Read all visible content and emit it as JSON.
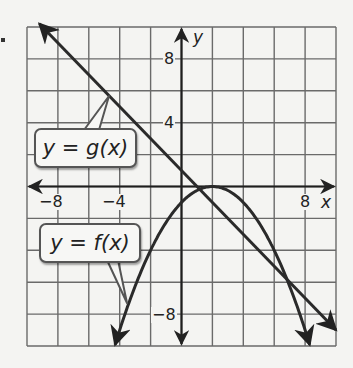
{
  "chart_data": {
    "type": "line",
    "title": "",
    "xlabel": "x",
    "ylabel": "y",
    "xlim": [
      -10,
      10
    ],
    "ylim": [
      -10,
      10
    ],
    "grid": true,
    "grid_step": 2,
    "x_tick_labels": [
      "-8",
      "-4",
      "8"
    ],
    "y_tick_labels": [
      "8",
      "4",
      "-8"
    ],
    "series": [
      {
        "name": "y = g(x)",
        "kind": "line",
        "equation_estimate": "g(x) = -x + 1",
        "points": [
          [
            -9,
            10
          ],
          [
            1,
            0
          ],
          [
            10,
            -9
          ]
        ],
        "arrows": "both ends"
      },
      {
        "name": "y = f(x)",
        "kind": "parabola",
        "equation_estimate": "f(x) = -0.25(x - 2)^2",
        "vertex": [
          2,
          0
        ],
        "points": [
          [
            -4,
            -9
          ],
          [
            -2,
            -4
          ],
          [
            0,
            -1
          ],
          [
            2,
            0
          ],
          [
            4,
            -1
          ],
          [
            6,
            -4
          ],
          [
            8,
            -9
          ]
        ],
        "arrows": "both ends"
      }
    ],
    "annotations": [
      {
        "text": "y = g(x)",
        "points_to": [
          -4.7,
          5.6
        ]
      },
      {
        "text": "y = f(x)",
        "points_to": [
          -3.6,
          -7.3
        ]
      }
    ]
  },
  "labels": {
    "g_callout": "y = g(x)",
    "f_callout": "y = f(x)",
    "x_axis": "x",
    "y_axis": "y",
    "x_ticks": [
      "−8",
      "−4",
      "8"
    ],
    "y_ticks": [
      "8",
      "4",
      "−8"
    ]
  },
  "colors": {
    "grid": "#6a6a6a",
    "axes": "#1e1e1e",
    "curves": "#2a2a2a",
    "background": "#f4f4f2"
  }
}
